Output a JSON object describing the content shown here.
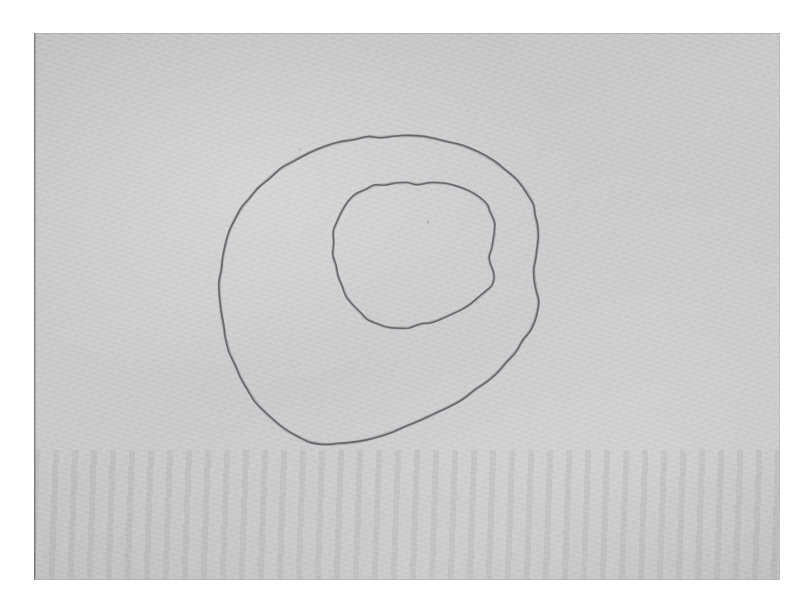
{
  "scan": {
    "background_color": "#ffffff",
    "paper_color": "#c9cacb",
    "paper_rect": {
      "x": 34,
      "y": 33,
      "width": 746,
      "height": 547
    },
    "medium": "pencil on gray textured paper",
    "title": "Scanned pencil drawing of two nested irregular closed curves",
    "stroke_color": "#5d5f62"
  },
  "drawing": {
    "description": "Two hand-drawn, roughly concentric, irregular closed loops (blob / oval outlines) sketched in graphite pencil on a sheet of gray toned paper. The outer loop is a large tilted oval; the inner loop is a smaller, more angular blob offset toward the upper right.",
    "shapes": [
      {
        "name": "outer-loop",
        "label": "Outer irregular closed curve",
        "bbox": {
          "x": 181,
          "y": 136,
          "width": 360,
          "height": 357
        },
        "center": {
          "x": 361,
          "y": 315
        },
        "stroke_color": "#5d5f62",
        "stroke_width": 1.6,
        "closed": true,
        "path": "M 356 103 L 381 104 L 406 107 L 430 112 L 452 120 L 268 0 Z"
      },
      {
        "name": "inner-loop",
        "label": "Inner irregular closed curve",
        "bbox": {
          "x": 314,
          "y": 183,
          "width": 168,
          "height": 167
        },
        "center": {
          "x": 398,
          "y": 266
        },
        "stroke_color": "#5d5f62",
        "stroke_width": 1.5,
        "closed": true,
        "path": "M 0 0 Z"
      }
    ],
    "specks": [
      {
        "name": "graphite-speck",
        "x": 428,
        "y": 222,
        "r": 1.6
      },
      {
        "name": "graphite-speck",
        "x": 300,
        "y": 150,
        "r": 1.1
      }
    ]
  },
  "geometry": {
    "outer_loop_points": [
      [
        347,
        104
      ],
      [
        368,
        103
      ],
      [
        390,
        104
      ],
      [
        410,
        108
      ],
      [
        428,
        113
      ],
      [
        444,
        120
      ],
      [
        458,
        128
      ],
      [
        470,
        136
      ],
      [
        481,
        145
      ],
      [
        490,
        154
      ],
      [
        496,
        163
      ],
      [
        499,
        172
      ],
      [
        501,
        182
      ],
      [
        503,
        193
      ],
      [
        504,
        205
      ],
      [
        503,
        216
      ],
      [
        501,
        226
      ],
      [
        500,
        237
      ],
      [
        501,
        248
      ],
      [
        503,
        258
      ],
      [
        504,
        268
      ],
      [
        503,
        278
      ],
      [
        500,
        288
      ],
      [
        495,
        298
      ],
      [
        489,
        308
      ],
      [
        482,
        318
      ],
      [
        474,
        328
      ],
      [
        464,
        338
      ],
      [
        453,
        348
      ],
      [
        441,
        357
      ],
      [
        428,
        366
      ],
      [
        414,
        374
      ],
      [
        400,
        381
      ],
      [
        385,
        388
      ],
      [
        370,
        394
      ],
      [
        354,
        400
      ],
      [
        338,
        405
      ],
      [
        322,
        409
      ],
      [
        306,
        411
      ],
      [
        291,
        411
      ],
      [
        277,
        409
      ],
      [
        264,
        404
      ],
      [
        252,
        397
      ],
      [
        241,
        389
      ],
      [
        231,
        379
      ],
      [
        222,
        368
      ],
      [
        214,
        357
      ],
      [
        207,
        345
      ],
      [
        201,
        332
      ],
      [
        196,
        319
      ],
      [
        192,
        306
      ],
      [
        189,
        292
      ],
      [
        187,
        278
      ],
      [
        186,
        264
      ],
      [
        186,
        250
      ],
      [
        187,
        237
      ],
      [
        189,
        224
      ],
      [
        192,
        211
      ],
      [
        196,
        198
      ],
      [
        201,
        186
      ],
      [
        208,
        175
      ],
      [
        216,
        164
      ],
      [
        225,
        154
      ],
      [
        236,
        144
      ],
      [
        248,
        135
      ],
      [
        261,
        127
      ],
      [
        275,
        120
      ],
      [
        290,
        114
      ],
      [
        305,
        110
      ],
      [
        320,
        106
      ],
      [
        334,
        104
      ]
    ],
    "inner_loop_points": [
      [
        384,
        151
      ],
      [
        398,
        150
      ],
      [
        412,
        151
      ],
      [
        425,
        154
      ],
      [
        436,
        159
      ],
      [
        445,
        165
      ],
      [
        452,
        172
      ],
      [
        457,
        180
      ],
      [
        460,
        189
      ],
      [
        461,
        198
      ],
      [
        460,
        207
      ],
      [
        457,
        216
      ],
      [
        455,
        224
      ],
      [
        456,
        232
      ],
      [
        459,
        239
      ],
      [
        460,
        246
      ],
      [
        457,
        253
      ],
      [
        452,
        259
      ],
      [
        445,
        265
      ],
      [
        437,
        271
      ],
      [
        428,
        276
      ],
      [
        418,
        281
      ],
      [
        408,
        285
      ],
      [
        397,
        289
      ],
      [
        386,
        292
      ],
      [
        375,
        294
      ],
      [
        364,
        295
      ],
      [
        353,
        294
      ],
      [
        343,
        291
      ],
      [
        334,
        286
      ],
      [
        326,
        280
      ],
      [
        319,
        272
      ],
      [
        313,
        263
      ],
      [
        308,
        253
      ],
      [
        304,
        243
      ],
      [
        301,
        232
      ],
      [
        299,
        221
      ],
      [
        299,
        210
      ],
      [
        300,
        199
      ],
      [
        303,
        188
      ],
      [
        308,
        178
      ],
      [
        314,
        169
      ],
      [
        322,
        162
      ],
      [
        331,
        157
      ],
      [
        341,
        153
      ],
      [
        352,
        151
      ],
      [
        363,
        150
      ],
      [
        374,
        150
      ]
    ],
    "coordinate_space": "paper-local (origin at paper top-left: 34,33)"
  }
}
